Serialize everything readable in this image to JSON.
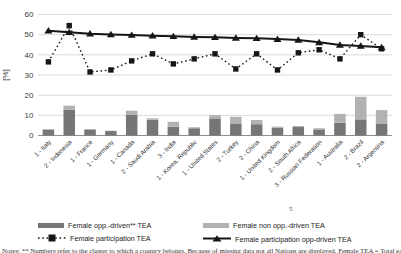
{
  "y_axis": {
    "label": "[%]"
  },
  "chart_data": {
    "type": "combo-bar-line",
    "title": "",
    "xlabel": "",
    "ylabel": "[%]",
    "ylim": [
      0,
      60
    ],
    "y_ticks": [
      0,
      10,
      20,
      30,
      40,
      50,
      60
    ],
    "grid": "horizontal",
    "legend_position": "bottom",
    "categories": [
      "1 - Italy",
      "2 - Indonesia",
      "1 - France",
      "1 - Germany",
      "1 - Canada",
      "2 - Saudi Arabia",
      "3 - India",
      "1 - Korea, Republic",
      "1 - United States",
      "2 - Turkey",
      "2 - China",
      "1 - United Kingdom",
      "2 - South Africa",
      "3 - Russian Federation",
      "1 - Australia",
      "2 - Brazil",
      "2 - Argentina"
    ],
    "series": [
      {
        "name": "Female opp.-driven** TEA",
        "type": "bar",
        "stack": "tea",
        "color": "#767676",
        "values": [
          2.9,
          12.7,
          3.0,
          2.2,
          10.2,
          7.8,
          4.4,
          3.6,
          8.5,
          6.0,
          5.6,
          3.9,
          4.2,
          3.0,
          6.4,
          8.0,
          6.0
        ]
      },
      {
        "name": "Female non opp.-driven TEA",
        "type": "bar",
        "stack": "tea",
        "color": "#b2b2b2",
        "values": [
          0.3,
          2.1,
          0.2,
          0.2,
          2.1,
          0.7,
          2.4,
          0.5,
          1.6,
          3.3,
          2.1,
          0.5,
          0.5,
          0.6,
          4.3,
          11.2,
          6.6
        ]
      },
      {
        "name": "Female participation TEA",
        "type": "line",
        "line_style": "dotted",
        "marker": "square",
        "color": "#161616",
        "values": [
          36.5,
          54.5,
          31.5,
          32.5,
          37,
          40.5,
          35.5,
          38,
          40.5,
          33,
          40.5,
          32.5,
          41,
          42.5,
          38,
          50,
          43
        ]
      },
      {
        "name": "Female participation opp-driven TEA",
        "type": "line",
        "line_style": "solid",
        "marker": "triangle",
        "color": "#161616",
        "values": [
          52,
          51.2,
          50.5,
          50.1,
          49.8,
          49.5,
          49.2,
          48.9,
          48.7,
          48.4,
          48.2,
          47.8,
          47.4,
          46.2,
          44.9,
          44.4,
          43.7
        ]
      }
    ]
  },
  "legend_note_mark": "5",
  "caption": "Notes: ** Numbers refer to the cluster to which a country belongs. Because of missing data not all Nations are displayed. Female TEA = Total early-stage Entrepreneurial Activity"
}
